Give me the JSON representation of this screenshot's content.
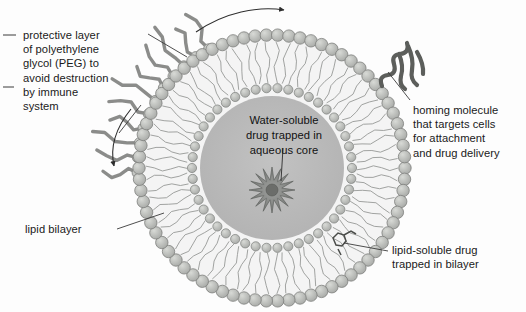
{
  "diagram": {
    "background_color": "#fdfdfd"
  },
  "labels": {
    "peg": "protective layer\nof polyethylene\nglycol (PEG) to\navoid destruction\nby immune\nsystem",
    "homing": "homing molecule\nthat targets cells\nfor attachment\nand drug delivery",
    "bilayer": "lipid bilayer",
    "lipid_soluble": "lipid-soluble drug\ntrapped in bilayer",
    "aqueous_core": "Water-soluble\ndrug trapped in\naqueous core"
  },
  "structure": {
    "center_x": 272,
    "center_y": 168,
    "outer_head_radius": 133,
    "inner_head_radius": 80,
    "core_radius": 72,
    "head_count_outer": 74,
    "head_count_inner": 46,
    "head_dot_radius_outer": 6.2,
    "head_dot_radius_inner": 4.6,
    "peg_chain_count": 11,
    "peg_arc_start_deg": 178,
    "peg_arc_end_deg": 242,
    "drug_star_points": 16,
    "drug_star_cx": 272,
    "drug_star_cy": 190,
    "drug_star_outer_r": 23,
    "drug_star_inner_r": 10
  },
  "colors": {
    "core_fill": "#b8b8b8",
    "bilayer_fill": "#f2f2f2",
    "head_fill": "#b3b5b2",
    "head_stroke": "#7d7f7c",
    "tail_stroke": "#8a8c89",
    "peg_fill": "#b9bbb8",
    "peg_stroke": "#7e807d",
    "homing_stroke": "#5c5e5b",
    "leader_stroke": "#3a3a3a",
    "arrow_stroke": "#2e2e2e",
    "text_color": "#1a1a1a"
  },
  "annotations": {
    "arrow_top_label": "curved-arrow-top-right",
    "arrow_left_label": "curved-arrow-left-down"
  }
}
